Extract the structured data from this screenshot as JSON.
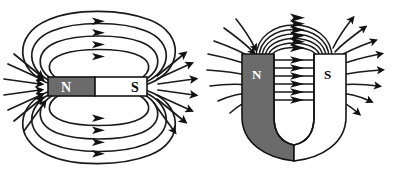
{
  "figure": {
    "background_color": "#ffffff",
    "line_color": "#1a1a1a",
    "panel_count": 2
  },
  "panels": [
    {
      "id": "bar-magnet",
      "name": "Bar magnet field diagram",
      "magnet_type": "bar",
      "poles": [
        {
          "label": "N",
          "side": "left",
          "fill": "#6b6b6b",
          "text_color": "#ffffff"
        },
        {
          "label": "S",
          "side": "right",
          "fill": "#ffffff",
          "text_color": "#000000"
        }
      ],
      "field_line_loops": 4,
      "radial_arrows_left": 7,
      "radial_arrows_right": 7,
      "field_direction_note": "arrowheads point toward the right (N to S sense drawn at loop apex)"
    },
    {
      "id": "horseshoe-magnet",
      "name": "Horseshoe (U-shaped) magnet field diagram",
      "magnet_type": "horseshoe",
      "poles": [
        {
          "label": "N",
          "side": "left",
          "fill": "#6b6b6b",
          "text_color": "#ffffff"
        },
        {
          "label": "S",
          "side": "right",
          "fill": "#ffffff",
          "text_color": "#000000"
        }
      ],
      "gap_field_lines": 6,
      "arch_field_lines": 6,
      "radial_arrows_left": 8,
      "radial_arrows_right": 8,
      "field_direction_note": "arrowheads point from the N arm across the gap toward the S arm"
    }
  ],
  "labels": {
    "north": "N",
    "south": "S"
  },
  "colors": {
    "magnet_dark": "#6b6b6b",
    "magnet_light": "#ffffff",
    "outline": "#141414",
    "field_line": "#1a1a1a"
  }
}
